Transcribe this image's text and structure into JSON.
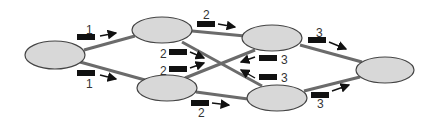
{
  "colors": {
    "node_fill": "#d8d8d8",
    "node_stroke": "#444444",
    "edge": "#6b6b6b",
    "packet": "#111111",
    "arrow": "#111111"
  },
  "nodes": [
    {
      "id": "source",
      "cx": 55,
      "cy": 55,
      "rx": 30,
      "ry": 14
    },
    {
      "id": "top-middle",
      "cx": 162,
      "cy": 30,
      "rx": 30,
      "ry": 13
    },
    {
      "id": "bottom-middle",
      "cx": 167,
      "cy": 88,
      "rx": 30,
      "ry": 13
    },
    {
      "id": "top-right-middle",
      "cx": 272,
      "cy": 38,
      "rx": 30,
      "ry": 13
    },
    {
      "id": "bottom-right-middle",
      "cx": 277,
      "cy": 98,
      "rx": 30,
      "ry": 13
    },
    {
      "id": "sink",
      "cx": 385,
      "cy": 70,
      "rx": 29,
      "ry": 13
    }
  ],
  "labels": [
    {
      "text": "1",
      "x": 86,
      "y": 24
    },
    {
      "text": "1",
      "x": 86,
      "y": 78
    },
    {
      "text": "2",
      "x": 203,
      "y": 9
    },
    {
      "text": "2",
      "x": 160,
      "y": 48
    },
    {
      "text": "2",
      "x": 160,
      "y": 65
    },
    {
      "text": "2",
      "x": 198,
      "y": 107
    },
    {
      "text": "3",
      "x": 316,
      "y": 27
    },
    {
      "text": "3",
      "x": 281,
      "y": 54
    },
    {
      "text": "3",
      "x": 281,
      "y": 72
    },
    {
      "text": "3",
      "x": 317,
      "y": 98
    }
  ]
}
